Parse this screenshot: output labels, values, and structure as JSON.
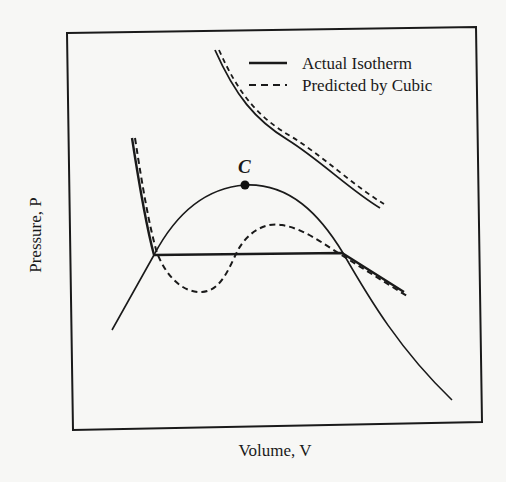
{
  "figure": {
    "x_axis_label": "Volume, V",
    "y_axis_label": "Pressure, P",
    "critical_point_label": "C",
    "legend": {
      "items": [
        {
          "label": "Actual Isotherm",
          "style": "solid"
        },
        {
          "label": "Predicted by Cubic",
          "style": "dashed"
        }
      ]
    },
    "curves": [
      {
        "name": "supercritical-isotherm-actual",
        "style": "solid"
      },
      {
        "name": "supercritical-isotherm-cubic",
        "style": "dashed"
      },
      {
        "name": "subcritical-isotherm-actual",
        "style": "solid",
        "note": "liquid branch, horizontal tie line, vapor branch"
      },
      {
        "name": "subcritical-isotherm-cubic",
        "style": "dashed",
        "note": "van der Waals loop"
      },
      {
        "name": "saturation-dome",
        "style": "solid",
        "note": "passes through critical point C"
      }
    ],
    "colors": {
      "ink": "#1a1a1a",
      "paper": "#f7f7f5"
    }
  }
}
